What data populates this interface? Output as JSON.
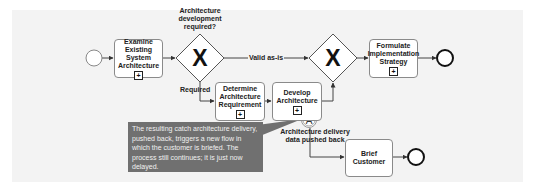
{
  "diagram": {
    "start_event": {
      "type": "start"
    },
    "tasks": [
      {
        "id": "examine",
        "label": "Examine Existing System Architecture",
        "lines": [
          "Examine Existing",
          "System",
          "Architecture"
        ],
        "subprocess": true
      },
      {
        "id": "determine",
        "label": "Determine Architecture Requirement",
        "lines": [
          "Determine",
          "Architecture",
          "Requirement"
        ],
        "subprocess": true
      },
      {
        "id": "develop",
        "label": "Develop Architecture",
        "lines": [
          "Develop",
          "Architecture"
        ],
        "subprocess": true
      },
      {
        "id": "formulate",
        "label": "Formulate Implementation Strategy",
        "lines": [
          "Formulate",
          "Implementation",
          "Strategy"
        ],
        "subprocess": true
      },
      {
        "id": "brief",
        "label": "Brief Customer",
        "lines": [
          "Brief Customer"
        ],
        "subprocess": false
      }
    ],
    "gateways": [
      {
        "id": "gw1",
        "type": "exclusive",
        "marker": "X",
        "question_lines": [
          "Architecture",
          "development",
          "required?"
        ]
      },
      {
        "id": "gw2",
        "type": "exclusive",
        "marker": "X"
      }
    ],
    "flows": {
      "valid_label": "Valid as-is",
      "required_label": "Required"
    },
    "boundary_event": {
      "marker": "A",
      "label_lines": [
        "Architecture delivery",
        "data pushed back"
      ]
    },
    "callout": {
      "text": "The resulting catch architecture delivery, pushed back, triggers a new flow in which the customer is briefed. The process still continues; it is just now delayed."
    },
    "end_events": [
      {
        "type": "end"
      },
      {
        "type": "end"
      }
    ]
  }
}
